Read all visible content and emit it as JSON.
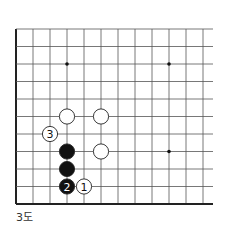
{
  "diagram": {
    "type": "go-board-partial",
    "caption": "3도",
    "grid": {
      "origin_x": 16,
      "origin_y": 29,
      "spacing_x": 17,
      "spacing_y": 17.5,
      "cols": 12,
      "rows": 11,
      "right_extent": 213,
      "edges": [
        "left",
        "bottom"
      ]
    },
    "star_points": [
      {
        "col": 3,
        "row": 2
      },
      {
        "col": 9,
        "row": 2
      },
      {
        "col": 9,
        "row": 7
      }
    ],
    "stones": [
      {
        "color": "white",
        "col": 3,
        "row": 5,
        "label": ""
      },
      {
        "color": "white",
        "col": 5,
        "row": 5,
        "label": ""
      },
      {
        "color": "white",
        "col": 2,
        "row": 6,
        "label": "3"
      },
      {
        "color": "black",
        "col": 3,
        "row": 7,
        "label": ""
      },
      {
        "color": "white",
        "col": 5,
        "row": 7,
        "label": ""
      },
      {
        "color": "black",
        "col": 3,
        "row": 8,
        "label": ""
      },
      {
        "color": "black",
        "col": 3,
        "row": 9,
        "label": "2"
      },
      {
        "color": "white",
        "col": 4,
        "row": 9,
        "label": "1"
      }
    ],
    "colors": {
      "line": "#555555",
      "edge": "#222222",
      "black_stone": "#111111",
      "white_stone": "#ffffff",
      "stone_outline": "#222222"
    }
  }
}
